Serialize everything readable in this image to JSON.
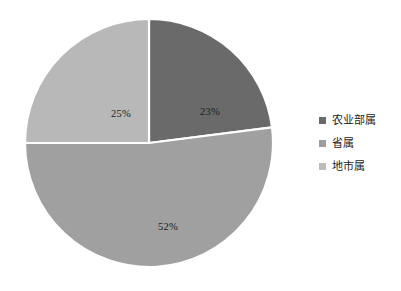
{
  "chart_data": {
    "type": "pie",
    "title": "",
    "labels": [
      "农业部属",
      "省属",
      "地市属"
    ],
    "values": [
      23,
      25,
      52
    ],
    "value_labels": [
      "23%",
      "25%",
      "52%"
    ],
    "units": "percent",
    "total": 100,
    "start_angle_deg": 0,
    "direction": "clockwise",
    "slice_colors": [
      "#6a6a6a",
      "#b8b8b8",
      "#a0a0a0"
    ],
    "slice_border_color": "#ffffff",
    "legend": {
      "position": "right",
      "entries": [
        {
          "label": "农业部属",
          "color": "#6a6a6a",
          "marker": "square-marker"
        },
        {
          "label": "省属",
          "color": "#9d9d9d",
          "marker": "square-marker"
        },
        {
          "label": "地市属",
          "color": "#bcbcbc",
          "marker": "square-marker"
        }
      ]
    },
    "grid": false,
    "xlabel": "",
    "ylabel": ""
  },
  "background_color": "#ffffff"
}
